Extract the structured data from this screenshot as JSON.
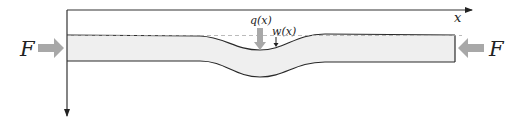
{
  "diagram": {
    "axes": {
      "x_label": "x",
      "y_axis_direction": "down"
    },
    "forces": {
      "left_label": "F",
      "right_label": "F",
      "load_label": "q(x)",
      "deflection_label": "w(x)"
    },
    "colors": {
      "beam_fill": "#efefef",
      "beam_edge": "#2a2a2a",
      "arrow_fill": "#a8a8a8",
      "axis": "#333333",
      "reference_line": "#aaaaaa"
    }
  }
}
